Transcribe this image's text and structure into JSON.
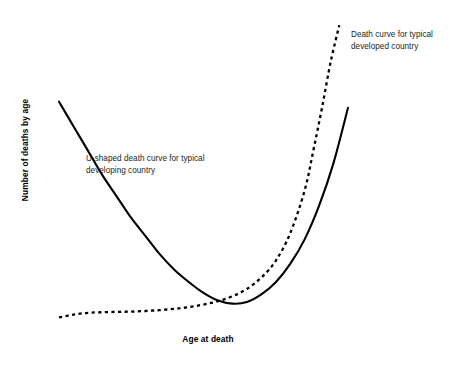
{
  "chart_data": {
    "type": "line",
    "title": "",
    "subtitle": "",
    "xlabel": "Age at death",
    "ylabel": "Number of deaths by age",
    "xlim": [
      0,
      100
    ],
    "ylim": [
      0,
      100
    ],
    "grid": false,
    "axis_ticks": false,
    "axis_lines": false,
    "legend": "none",
    "legend_position": "inline-annotations",
    "series": [
      {
        "name": "U-shaped death curve for typical developing country",
        "style": "solid",
        "color": "#000000",
        "linewidth": 2,
        "points": [
          {
            "x": 0,
            "y": 72
          },
          {
            "x": 5,
            "y": 64
          },
          {
            "x": 10,
            "y": 56
          },
          {
            "x": 15,
            "y": 48
          },
          {
            "x": 20,
            "y": 41
          },
          {
            "x": 25,
            "y": 34
          },
          {
            "x": 30,
            "y": 28
          },
          {
            "x": 35,
            "y": 22
          },
          {
            "x": 40,
            "y": 17
          },
          {
            "x": 45,
            "y": 13
          },
          {
            "x": 50,
            "y": 9.5
          },
          {
            "x": 55,
            "y": 7
          },
          {
            "x": 60,
            "y": 6
          },
          {
            "x": 65,
            "y": 6.5
          },
          {
            "x": 70,
            "y": 9
          },
          {
            "x": 75,
            "y": 13
          },
          {
            "x": 80,
            "y": 19
          },
          {
            "x": 85,
            "y": 27
          },
          {
            "x": 90,
            "y": 38
          },
          {
            "x": 95,
            "y": 52
          },
          {
            "x": 100,
            "y": 70
          }
        ]
      },
      {
        "name": "Death curve for typical developed country",
        "style": "dotted",
        "color": "#000000",
        "linewidth": 2,
        "points": [
          {
            "x": 0,
            "y": 1.5
          },
          {
            "x": 5,
            "y": 2.4
          },
          {
            "x": 10,
            "y": 3.0
          },
          {
            "x": 15,
            "y": 3.2
          },
          {
            "x": 20,
            "y": 3.3
          },
          {
            "x": 25,
            "y": 3.4
          },
          {
            "x": 30,
            "y": 3.6
          },
          {
            "x": 35,
            "y": 3.9
          },
          {
            "x": 40,
            "y": 4.3
          },
          {
            "x": 45,
            "y": 4.9
          },
          {
            "x": 50,
            "y": 5.7
          },
          {
            "x": 55,
            "y": 6.8
          },
          {
            "x": 60,
            "y": 8.4
          },
          {
            "x": 65,
            "y": 10.8
          },
          {
            "x": 70,
            "y": 14.5
          },
          {
            "x": 75,
            "y": 20
          },
          {
            "x": 80,
            "y": 29
          },
          {
            "x": 85,
            "y": 43
          },
          {
            "x": 88,
            "y": 56
          },
          {
            "x": 91,
            "y": 70
          },
          {
            "x": 94,
            "y": 85
          },
          {
            "x": 97,
            "y": 97
          }
        ]
      }
    ],
    "annotations": [
      {
        "id": "developing",
        "text_line_1": "U-shaped death curve for typical",
        "text_line_2": "developing country",
        "target_series": "U-shaped death curve for typical developing country"
      },
      {
        "id": "developed",
        "text_line_1": "Death curve for typical",
        "text_line_2": "developed country",
        "target_series": "Death curve for typical developed country"
      }
    ]
  },
  "labels": {
    "x_axis": "Age at death",
    "y_axis": "Number of deaths by age",
    "annotation_developing_line1": "U-shaped death curve for typical",
    "annotation_developing_line2": "developing country",
    "annotation_developed_line1": "Death curve for typical",
    "annotation_developed_line2": "developed country"
  },
  "colors": {
    "background": "#ffffff",
    "curve": "#000000",
    "text": "#231f20",
    "axis_label": "#000000"
  }
}
